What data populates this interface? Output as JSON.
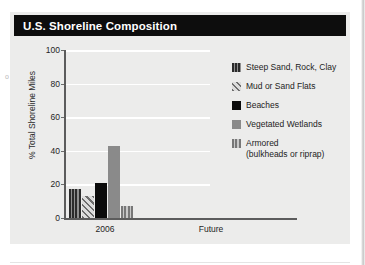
{
  "figure": {
    "title": "U.S. Shoreline Composition"
  },
  "page_bleed": {
    "left_fragments": "o",
    "right_fragment": "y"
  },
  "chart_data": {
    "type": "bar",
    "title": "U.S. Shoreline Composition",
    "xlabel": "",
    "ylabel": "% Total Shoreline Miles",
    "categories": [
      "2006",
      "Future"
    ],
    "ylim": [
      0,
      100
    ],
    "yticks": [
      0,
      20,
      40,
      60,
      80,
      100
    ],
    "grid": true,
    "legend_position": "right",
    "series": [
      {
        "name": "Steep Sand, Rock, Clay",
        "pattern": "vertical-stripes-dark",
        "color": "#3a3a3a",
        "values": [
          17,
          null
        ]
      },
      {
        "name": "Mud or Sand Flats",
        "pattern": "diagonal-hatch",
        "color": "#8f8f8f",
        "values": [
          13,
          null
        ]
      },
      {
        "name": "Beaches",
        "pattern": "solid",
        "color": "#0b0b0b",
        "values": [
          21,
          null
        ]
      },
      {
        "name": "Vegetated Wetlands",
        "pattern": "solid",
        "color": "#8a8a8a",
        "values": [
          43,
          null
        ]
      },
      {
        "name": "Armored (bulkheads or riprap)",
        "pattern": "vertical-stripes-gray",
        "color": "#9a9a9a",
        "values": [
          7,
          null
        ]
      }
    ]
  },
  "legend": {
    "entries": [
      {
        "label": "Steep Sand, Rock, Clay",
        "sub": ""
      },
      {
        "label": "Mud or Sand Flats",
        "sub": ""
      },
      {
        "label": "Beaches",
        "sub": ""
      },
      {
        "label": "Vegetated Wetlands",
        "sub": ""
      },
      {
        "label": "Armored",
        "sub": "(bulkheads or riprap)"
      }
    ]
  },
  "axes": {
    "y_tick_labels": [
      "100",
      "80",
      "60",
      "40",
      "20",
      "0"
    ],
    "x_tick_labels": [
      "2006",
      "Future"
    ]
  }
}
